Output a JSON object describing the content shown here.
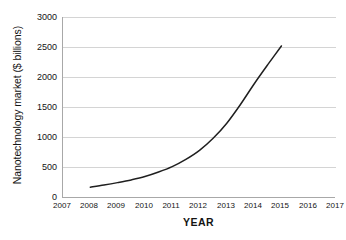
{
  "chart_data": {
    "type": "line",
    "title": "",
    "xlabel": "YEAR",
    "ylabel": "Nanotechnology market ($ billions)",
    "xlim": [
      2007,
      2017
    ],
    "ylim": [
      0,
      3000
    ],
    "grid": true,
    "legend": false,
    "x_ticks": [
      "2007",
      "2008",
      "2009",
      "2010",
      "2011",
      "2012",
      "2013",
      "2014",
      "2015",
      "2016",
      "2017"
    ],
    "y_ticks": [
      "0",
      "500",
      "1000",
      "1500",
      "2000",
      "2500",
      "3000"
    ],
    "line_color": "#1f1f1f",
    "grid_color": "#d4d4d4",
    "axis_color": "#a8a8a8",
    "series": [
      {
        "name": "Nanotechnology market",
        "x": [
          2008,
          2008.5,
          2009,
          2009.5,
          2010,
          2010.5,
          2011,
          2011.5,
          2012,
          2012.5,
          2013,
          2013.5,
          2014,
          2014.5,
          2015
        ],
        "values": [
          180,
          215,
          255,
          300,
          355,
          430,
          520,
          640,
          790,
          990,
          1240,
          1550,
          1890,
          2210,
          2520
        ]
      }
    ]
  },
  "axis_labels": {
    "y": [
      "3000",
      "2500",
      "2000",
      "1500",
      "1000",
      "500",
      "0"
    ],
    "x": [
      "2007",
      "2008",
      "2009",
      "2010",
      "2011",
      "2012",
      "2013",
      "2014",
      "2015",
      "2016",
      "2017"
    ]
  }
}
